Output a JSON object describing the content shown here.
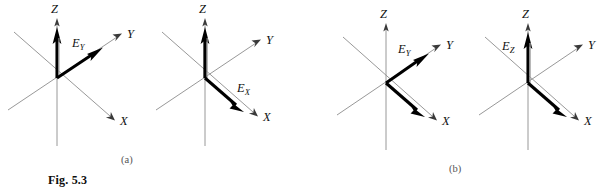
{
  "figure": {
    "caption": "Fig. 5.3",
    "panels": [
      {
        "id": "a",
        "label": "(a)"
      },
      {
        "id": "b",
        "label": "(b)"
      }
    ]
  },
  "diagrams": [
    {
      "id": "a1",
      "panel": "a",
      "axis_labels": {
        "z": "Z",
        "y": "Y",
        "x": "X"
      },
      "field_label": "E",
      "field_subscript": "Y",
      "vectors": [
        "Z",
        "Y"
      ]
    },
    {
      "id": "a2",
      "panel": "a",
      "axis_labels": {
        "z": "Z",
        "y": "Y",
        "x": "X"
      },
      "field_label": "E",
      "field_subscript": "X",
      "vectors": [
        "Z",
        "X"
      ]
    },
    {
      "id": "b1",
      "panel": "b",
      "axis_labels": {
        "z": "Z",
        "y": "Y",
        "x": "X"
      },
      "field_label": "E",
      "field_subscript": "Y",
      "vectors": [
        "Y",
        "X"
      ]
    },
    {
      "id": "b2",
      "panel": "b",
      "axis_labels": {
        "z": "Z",
        "y": "Y",
        "x": "X"
      },
      "field_label": "E",
      "field_subscript": "Z",
      "vectors": [
        "Z",
        "X"
      ]
    }
  ],
  "colors": {
    "axis": "#8c8c8c",
    "vector": "#000000",
    "vector_highlight": "#9a9a9a",
    "text": "#111111",
    "panel_label": "#555555",
    "background": "#ffffff"
  }
}
